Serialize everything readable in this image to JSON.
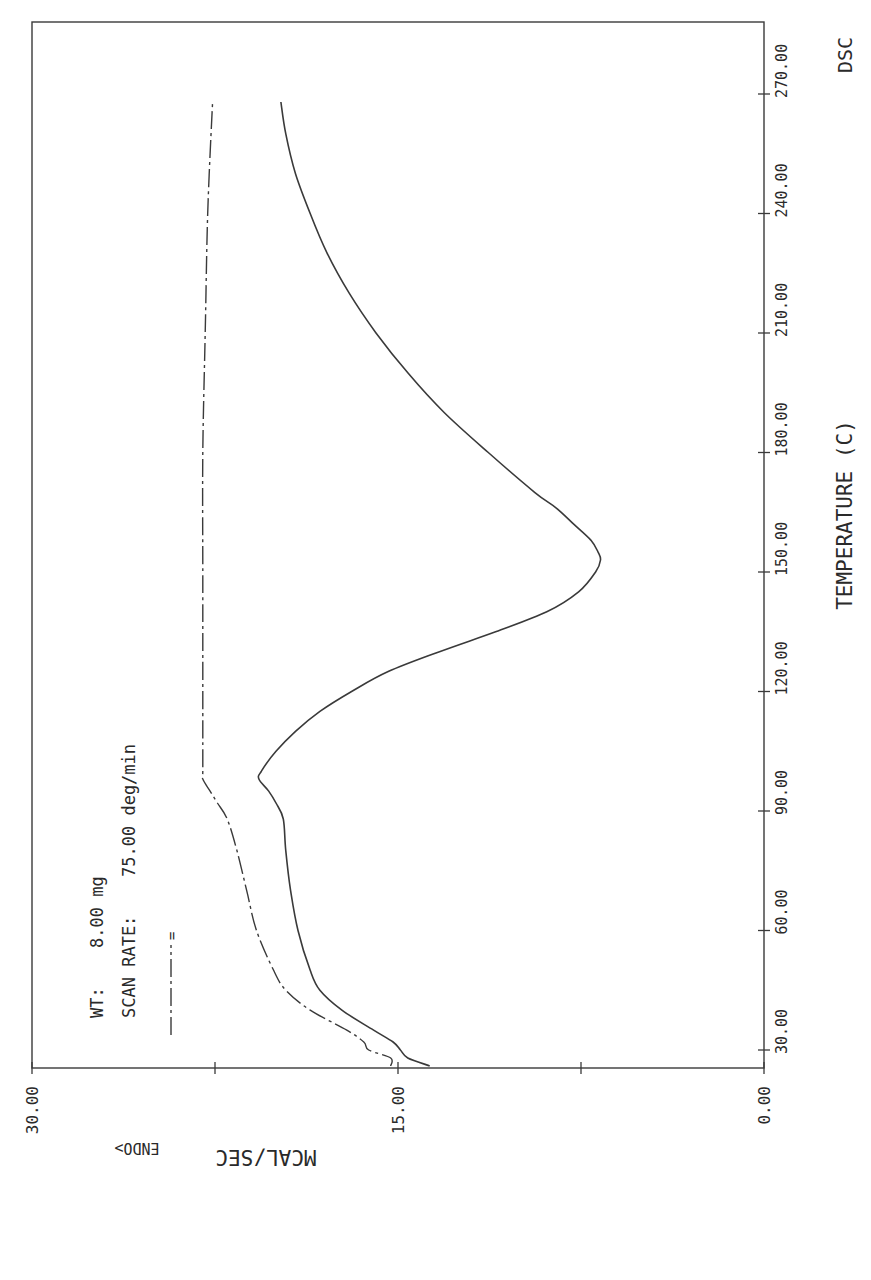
{
  "chart_data": {
    "type": "line",
    "title": "DSC",
    "xlabel": "TEMPERATURE (C)",
    "ylabel": "MCAL/SEC",
    "ylabel_note": "ENDO>",
    "orientation": "rotated 90° (temperature axis vertical on right, heat flow horizontal on bottom)",
    "x_ticks": [
      "30.00",
      "60.00",
      "90.00",
      "120.00",
      "150.00",
      "180.00",
      "210.00",
      "240.00",
      "270.00"
    ],
    "y_ticks": [
      "0.00",
      "15.00",
      "30.00"
    ],
    "xlim": [
      26,
      280
    ],
    "ylim": [
      0,
      30
    ],
    "grid": false,
    "annotations": {
      "wt_label": "WT:",
      "wt_value": "8.00 mg",
      "scan_rate_label": "SCAN RATE:",
      "scan_rate_value": "75.00 deg/min",
      "legend_marker": "=",
      "legend_line_style": "dash-dot"
    },
    "series": [
      {
        "name": "first scan (solid)",
        "style": "solid",
        "x": [
          26,
          28,
          30,
          32,
          35,
          40,
          45,
          50,
          60,
          70,
          80,
          88,
          92,
          95,
          98,
          100,
          105,
          110,
          115,
          120,
          125,
          130,
          135,
          140,
          145,
          150,
          153,
          155,
          158,
          162,
          166,
          170,
          180,
          190,
          200,
          210,
          220,
          230,
          240,
          250,
          260,
          268
        ],
        "y": [
          13.7,
          14.6,
          14.9,
          15.2,
          16.0,
          17.3,
          18.2,
          18.6,
          19.1,
          19.4,
          19.6,
          19.7,
          20.0,
          20.3,
          20.7,
          20.6,
          20.0,
          19.2,
          18.2,
          16.9,
          15.4,
          13.3,
          11.0,
          8.9,
          7.6,
          6.9,
          6.7,
          6.8,
          7.1,
          7.8,
          8.5,
          9.4,
          11.3,
          13.1,
          14.6,
          15.9,
          17.0,
          17.9,
          18.6,
          19.2,
          19.6,
          19.8
        ]
      },
      {
        "name": "second scan (dash-dot)",
        "style": "dash-dot",
        "x": [
          26,
          28,
          30,
          32,
          35,
          40,
          45,
          50,
          60,
          70,
          80,
          88,
          92,
          95,
          98,
          100,
          110,
          130,
          150,
          180,
          210,
          240,
          268
        ],
        "y": [
          15.3,
          15.3,
          16.2,
          16.4,
          17.1,
          18.6,
          19.6,
          20.1,
          20.8,
          21.2,
          21.6,
          22.0,
          22.4,
          22.7,
          23.0,
          23.0,
          23.0,
          23.0,
          23.0,
          23.0,
          22.9,
          22.8,
          22.6
        ]
      }
    ]
  }
}
